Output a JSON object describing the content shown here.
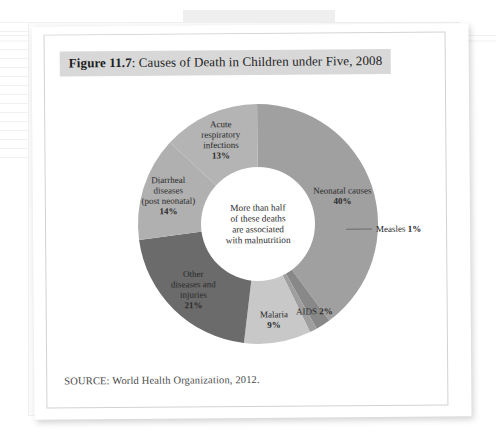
{
  "figure": {
    "label": "Figure 11.7",
    "title": ": Causes of Death in Children under Five, 2008",
    "source": "SOURCE: World Health Organization, 2012.",
    "center_note_lines": [
      "More than half",
      "of these deaths",
      "are associated",
      "with malnutrition"
    ]
  },
  "chart_data": {
    "type": "pie",
    "title": "Causes of Death in Children under Five, 2008",
    "subtitle": "",
    "xlabel": "",
    "ylabel": "",
    "legend": "none (labels on slices)",
    "donut": true,
    "units": "percent",
    "annotation": "More than half of these deaths are associated with malnutrition",
    "categories": [
      "Neonatal causes",
      "AIDS",
      "Measles",
      "Malaria",
      "Other diseases and injuries",
      "Diarrheal diseases (post neonatal)",
      "Acute respiratory infections"
    ],
    "values": [
      40,
      2,
      1,
      9,
      21,
      14,
      13
    ],
    "colors": [
      "#a0a0a0",
      "#888888",
      "#9e9e9e",
      "#c8c8c8",
      "#6b6b6b",
      "#b0b0b0",
      "#b4b4b4"
    ],
    "slices": [
      {
        "name": "Neonatal causes",
        "value": 40,
        "value_label": "40%",
        "label_lines": [
          "Neonatal causes"
        ],
        "color": "#a0a0a0",
        "label_placement": "inside"
      },
      {
        "name": "AIDS",
        "value": 2,
        "value_label": "2%",
        "label_lines": [
          "AIDS"
        ],
        "color": "#888888",
        "label_placement": "inside-right"
      },
      {
        "name": "Measles",
        "value": 1,
        "value_label": "1%",
        "label_lines": [
          "Measles"
        ],
        "color": "#9e9e9e",
        "label_placement": "callout-right"
      },
      {
        "name": "Malaria",
        "value": 9,
        "value_label": "9%",
        "label_lines": [
          "Malaria"
        ],
        "color": "#c8c8c8",
        "label_placement": "inside"
      },
      {
        "name": "Other diseases and injuries",
        "value": 21,
        "value_label": "21%",
        "label_lines": [
          "Other",
          "diseases and",
          "injuries"
        ],
        "color": "#6b6b6b",
        "label_placement": "inside"
      },
      {
        "name": "Diarrheal diseases (post neonatal)",
        "value": 14,
        "value_label": "14%",
        "label_lines": [
          "Diarrheal",
          "diseases",
          "(post neonatal)"
        ],
        "color": "#b0b0b0",
        "label_placement": "inside"
      },
      {
        "name": "Acute respiratory infections",
        "value": 13,
        "value_label": "13%",
        "label_lines": [
          "Acute",
          "respiratory",
          "infections"
        ],
        "color": "#b4b4b4",
        "label_placement": "inside"
      }
    ]
  }
}
